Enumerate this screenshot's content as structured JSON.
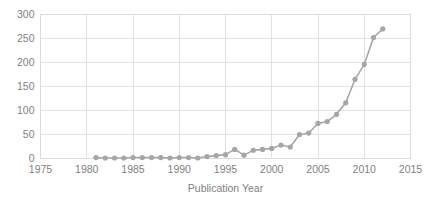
{
  "chart_data": {
    "type": "line",
    "title": "",
    "subtitle": "",
    "xlabel": "Publication Year",
    "ylabel": "",
    "xlim": [
      1975,
      2015
    ],
    "ylim": [
      0,
      300
    ],
    "grid": true,
    "legend": false,
    "legend_position": "none",
    "xticks": [
      1975,
      1980,
      1985,
      1990,
      1995,
      2000,
      2005,
      2010,
      2015
    ],
    "xtick_labels": [
      "1975",
      "1980",
      "1985",
      "1990",
      "1995",
      "2000",
      "2005",
      "2010",
      "2015"
    ],
    "yticks": [
      0,
      50,
      100,
      150,
      200,
      250,
      300
    ],
    "ytick_labels": [
      "0",
      "50",
      "100",
      "150",
      "200",
      "250",
      "300"
    ],
    "marker": "circle",
    "series_color": "#a6a6a6",
    "grid_color": "#d9d9d9",
    "text_color": "#7f7f7f",
    "background_color": "#ffffff",
    "x": [
      1981,
      1982,
      1983,
      1984,
      1985,
      1986,
      1987,
      1988,
      1989,
      1990,
      1991,
      1992,
      1993,
      1994,
      1995,
      1996,
      1997,
      1998,
      1999,
      2000,
      2001,
      2002,
      2003,
      2004,
      2005,
      2006,
      2007,
      2008,
      2009,
      2010,
      2011,
      2012
    ],
    "values": [
      2,
      1,
      1,
      1,
      2,
      2,
      2,
      2,
      1,
      2,
      2,
      1,
      4,
      6,
      8,
      19,
      7,
      17,
      19,
      21,
      28,
      24,
      50,
      53,
      73,
      77,
      92,
      116,
      165,
      196,
      252,
      270
    ],
    "annotations": []
  },
  "axis": {
    "x_title": "Publication Year"
  }
}
